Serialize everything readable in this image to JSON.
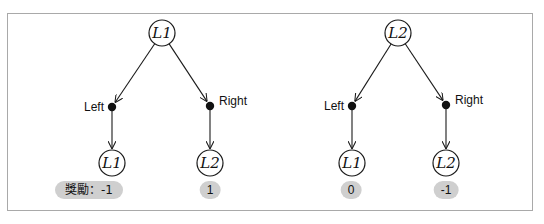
{
  "diagram": {
    "title": "",
    "trees": [
      {
        "root": {
          "label": "L1",
          "x": 162,
          "y": 33
        },
        "branches": [
          {
            "action": "Left",
            "dot": {
              "x": 112,
              "y": 107
            },
            "label_side": "left",
            "leaf": {
              "label": "L1",
              "x": 112,
              "y": 163
            },
            "reward": {
              "text": "獎勵：-1",
              "x": 89,
              "y": 181,
              "wide": true
            }
          },
          {
            "action": "Right",
            "dot": {
              "x": 210,
              "y": 106
            },
            "label_side": "right",
            "leaf": {
              "label": "L2",
              "x": 210,
              "y": 163
            },
            "reward": {
              "text": "1",
              "x": 210,
              "y": 181,
              "wide": false
            }
          }
        ]
      },
      {
        "root": {
          "label": "L2",
          "x": 398,
          "y": 33
        },
        "branches": [
          {
            "action": "Left",
            "dot": {
              "x": 352,
              "y": 106
            },
            "label_side": "left",
            "leaf": {
              "label": "L1",
              "x": 352,
              "y": 163
            },
            "reward": {
              "text": "0",
              "x": 351,
              "y": 181,
              "wide": false
            }
          },
          {
            "action": "Right",
            "dot": {
              "x": 446,
              "y": 105
            },
            "label_side": "right",
            "leaf": {
              "label": "L2",
              "x": 446,
              "y": 163
            },
            "reward": {
              "text": "-1",
              "x": 446,
              "y": 181,
              "wide": false
            }
          }
        ]
      }
    ],
    "colors": {
      "stroke": "#1a1a1a",
      "badge_bg": "#cfcfcf",
      "frame_border": "#a9a9a9"
    }
  }
}
